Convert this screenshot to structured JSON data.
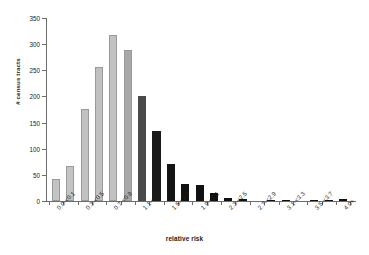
{
  "chart_data": {
    "type": "bar",
    "title": "",
    "xlabel": "relative risk",
    "ylabel": "# census tracts",
    "ylim": [
      0,
      350
    ],
    "ytick_values": [
      0,
      50,
      100,
      150,
      200,
      250,
      300,
      350
    ],
    "ytick_labels": [
      "0",
      "50",
      "100",
      "150",
      "200",
      "250",
      "300",
      "350"
    ],
    "grid": false,
    "legend": "none",
    "categories": [
      "0.0-<0.1",
      "0.1-<0.3",
      "0.3-<0.5",
      "0.5-<0.7",
      "0.7-<0.9",
      "0.9-<1.1",
      "1.1-<1.3",
      "1.3-<1.5",
      "1.5-<1.7",
      "1.7-<1.9",
      "1.9-<2.1",
      "2.1-<2.3",
      "2.3-<2.5",
      "2.5-<2.7",
      "2.7-<2.9",
      "2.9-<3.1",
      "3.1-<3.3",
      "3.3-<3.5",
      "3.5-<3.7",
      "3.7-<3.9",
      "4.0+"
    ],
    "visible_tick_labels": [
      "0.0-<0.1",
      "0.3-<0.5",
      "0.7-<0.9",
      "1.1-<1.3",
      "1.5-<1.7",
      "1.9-<2.1",
      "2.3-<2.5",
      "2.7-<2.9",
      "3.1-<3.3",
      "3.5-<3.7",
      "4.0+"
    ],
    "values": [
      43,
      67,
      176,
      257,
      318,
      288,
      201,
      133,
      70,
      33,
      31,
      15,
      6,
      3,
      0,
      1,
      1,
      0,
      1,
      2,
      3
    ],
    "bar_colors": [
      "#c4c4c4",
      "#c4c4c4",
      "#c2c2c2",
      "#c0c0c0",
      "#c2c2c2",
      "#a8a8a8",
      "#4a4a4a",
      "#1a1a1a",
      "#141414",
      "#111111",
      "#111111",
      "#111111",
      "#111111",
      "#111111",
      "#111111",
      "#111111",
      "#111111",
      "#111111",
      "#111111",
      "#111111",
      "#111111"
    ]
  },
  "axis": {
    "line_color": "#6d6d6d",
    "text_color": "#1a1a1a"
  }
}
